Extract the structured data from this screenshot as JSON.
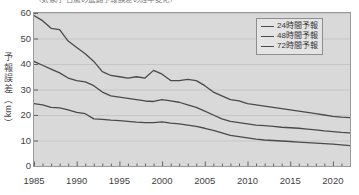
{
  "top_caption": "（気象庁 台風の進路予報誤差の経年変化）",
  "legend": {
    "position": "top-right",
    "items": [
      {
        "label": "24時間予報",
        "color": "#4a4a4a"
      },
      {
        "label": "48時間予報",
        "color": "#4a4a4a"
      },
      {
        "label": "72時間予報",
        "color": "#4a4a4a"
      }
    ]
  },
  "axes": {
    "y_title_chars": [
      "予",
      "報",
      "誤",
      "差"
    ],
    "y_title_unit": "km",
    "y_title_open": "（",
    "y_title_close": "）",
    "y_ticks": [
      "0",
      "10",
      "20",
      "30",
      "40",
      "50",
      "60"
    ],
    "x_ticks": [
      "1985",
      "1990",
      "1995",
      "2000",
      "2005",
      "2010",
      "2015",
      "2020"
    ]
  },
  "chart_data": {
    "type": "line",
    "title": "",
    "xlabel": "",
    "ylabel": "予報誤差（km）",
    "xlim": [
      1985,
      2022
    ],
    "ylim": [
      0,
      60
    ],
    "grid": true,
    "legend_position": "top-right",
    "x": [
      1985,
      1986,
      1987,
      1988,
      1989,
      1990,
      1991,
      1992,
      1993,
      1994,
      1995,
      1996,
      1997,
      1998,
      1999,
      2000,
      2001,
      2002,
      2003,
      2004,
      2005,
      2006,
      2007,
      2008,
      2009,
      2010,
      2011,
      2012,
      2013,
      2014,
      2015,
      2016,
      2017,
      2018,
      2019,
      2020,
      2021,
      2022
    ],
    "series": [
      {
        "name": "24時間予報",
        "color": "#4a4a4a",
        "values": [
          24.5,
          24.0,
          23.0,
          22.8,
          22.0,
          21.0,
          20.5,
          18.5,
          18.3,
          18.0,
          17.8,
          17.5,
          17.2,
          17.0,
          17.0,
          17.3,
          16.8,
          16.5,
          16.0,
          15.5,
          14.8,
          14.0,
          13.0,
          12.0,
          11.5,
          11.0,
          10.5,
          10.2,
          10.0,
          9.8,
          9.6,
          9.4,
          9.2,
          9.0,
          8.8,
          8.6,
          8.3,
          8.0
        ]
      },
      {
        "name": "48時間予報",
        "color": "#4a4a4a",
        "values": [
          41.0,
          39.5,
          38.0,
          36.5,
          34.5,
          33.5,
          33.0,
          31.5,
          29.0,
          27.5,
          27.0,
          26.5,
          26.0,
          25.5,
          25.3,
          26.0,
          25.5,
          25.0,
          24.0,
          23.0,
          21.5,
          20.0,
          18.5,
          17.5,
          17.0,
          16.5,
          16.0,
          15.8,
          15.5,
          15.2,
          15.0,
          14.8,
          14.5,
          14.2,
          13.8,
          13.5,
          13.2,
          13.0
        ]
      },
      {
        "name": "72時間予報",
        "color": "#4a4a4a",
        "values": [
          59.0,
          57.0,
          54.0,
          53.5,
          49.0,
          46.5,
          44.0,
          41.0,
          37.0,
          35.5,
          35.0,
          34.5,
          35.0,
          34.5,
          37.5,
          36.0,
          33.5,
          33.5,
          34.0,
          33.5,
          31.5,
          29.0,
          27.5,
          26.0,
          25.5,
          24.5,
          24.0,
          23.5,
          23.0,
          22.5,
          22.0,
          21.5,
          21.0,
          20.5,
          20.0,
          19.5,
          19.2,
          19.0
        ]
      }
    ]
  }
}
